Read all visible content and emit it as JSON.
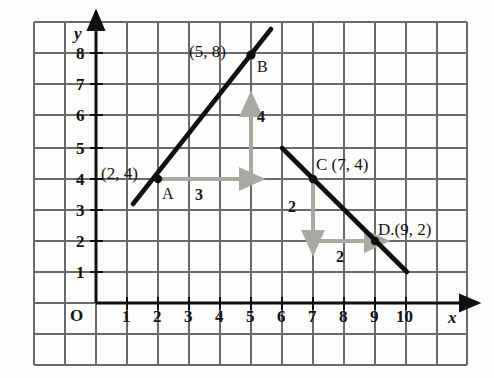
{
  "figure": {
    "type": "coordinate-grid-diagram",
    "axes": {
      "x_label": "x",
      "y_label": "y",
      "origin_label": "O",
      "x_ticks": [
        "1",
        "2",
        "3",
        "4",
        "5",
        "6",
        "7",
        "8",
        "9",
        "10"
      ],
      "y_ticks": [
        "1",
        "2",
        "3",
        "4",
        "5",
        "6",
        "7",
        "8"
      ],
      "x_range": [
        0,
        11.9
      ],
      "y_range": [
        0,
        9.6
      ],
      "grid": true
    },
    "colors": {
      "grid": "#5d5d63",
      "grid_faint": "#c8c6c2",
      "line": "#12100e",
      "arrow": "#aaa8a4",
      "text": "#14120f",
      "background": "#fdfdfc"
    },
    "lines": [
      {
        "name": "line-AB",
        "from": [
          1.2,
          3.2
        ],
        "to": [
          5.62,
          8.85
        ],
        "slope": 1.3333,
        "through": [
          [
            2,
            4
          ],
          [
            5,
            8
          ]
        ]
      },
      {
        "name": "line-CD",
        "from": [
          6.0,
          5.0
        ],
        "to": [
          10.05,
          0.95
        ],
        "slope": -1,
        "through": [
          [
            7,
            4
          ],
          [
            9,
            2
          ]
        ]
      }
    ],
    "points": [
      {
        "name": "A",
        "x": 2,
        "y": 4,
        "coord_label": "(2, 4)",
        "point_label": "A"
      },
      {
        "name": "B",
        "x": 5,
        "y": 8,
        "coord_label": "(5, 8)",
        "point_label": "B"
      },
      {
        "name": "C",
        "x": 7,
        "y": 4,
        "coord_label": "C (7, 4)",
        "point_label": ""
      },
      {
        "name": "D",
        "x": 9,
        "y": 2,
        "coord_label": "D.(9, 2)",
        "point_label": ""
      }
    ],
    "slope_triangles": [
      {
        "name": "triangle-AB",
        "run": {
          "from": [
            2,
            4
          ],
          "to": [
            5,
            4
          ],
          "label": "3",
          "direction": "right"
        },
        "rise": {
          "from": [
            5,
            4
          ],
          "to": [
            5,
            8
          ],
          "label": "4",
          "direction": "up"
        }
      },
      {
        "name": "triangle-CD",
        "rise": {
          "from": [
            7,
            4
          ],
          "to": [
            7,
            2
          ],
          "label": "2",
          "direction": "down"
        },
        "run": {
          "from": [
            7,
            2
          ],
          "to": [
            9,
            2
          ],
          "label": "2",
          "direction": "right"
        }
      }
    ]
  }
}
